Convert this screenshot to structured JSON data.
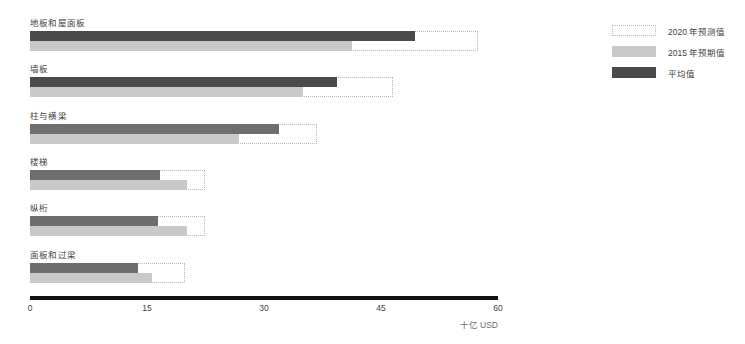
{
  "chart_data": {
    "type": "bar",
    "title": "",
    "subtitle": "",
    "xlabel": "十亿 USD",
    "ylabel": "",
    "orientation": "horizontal",
    "xlim": [
      0,
      60
    ],
    "xticks": [
      "0",
      "15",
      "30",
      "45",
      "60"
    ],
    "xtick_values": [
      0,
      15,
      30,
      45,
      60
    ],
    "grid": false,
    "legend_position": "right",
    "categories": [
      "地板和屋面板",
      "墙板",
      "柱与横梁",
      "楼梯",
      "纵桁",
      "面板和过梁"
    ],
    "series": [
      {
        "name": "2020 年预测值",
        "style": "dotted-outline",
        "color": "#b9b9b9",
        "values": [
          57.4,
          46.5,
          36.8,
          22.4,
          22.4,
          19.9
        ]
      },
      {
        "name": "2015 年预期值",
        "style": "filled",
        "color": "#c9c9c9",
        "values": [
          41.3,
          35.0,
          26.8,
          20.1,
          20.1,
          15.6
        ]
      },
      {
        "name": "平均值",
        "style": "filled",
        "color": "#4a4a4a",
        "values": [
          49.4,
          39.4,
          31.9,
          16.7,
          16.4,
          13.8
        ]
      }
    ]
  },
  "legend": {
    "items": [
      {
        "label": "2020 年预测值",
        "swatch": "forecast"
      },
      {
        "label": "2015 年预期值",
        "swatch": "c2015"
      },
      {
        "label": "平均值",
        "swatch": "avg"
      }
    ]
  },
  "axis": {
    "unit_label": "十亿 USD"
  }
}
